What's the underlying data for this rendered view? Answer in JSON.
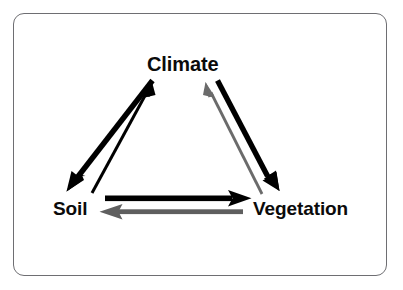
{
  "diagram": {
    "type": "cyclic-feedback-triangle",
    "title": "",
    "frame": {
      "shape": "rounded-rectangle",
      "border_color": "#6e6e72"
    },
    "nodes": [
      {
        "id": "climate",
        "label": "Climate",
        "position": "top"
      },
      {
        "id": "soil",
        "label": "Soil",
        "position": "bottom-left"
      },
      {
        "id": "vegetation",
        "label": "Vegetation",
        "position": "bottom-right"
      }
    ],
    "edges": [
      {
        "id": "climate-to-soil",
        "from": "Climate",
        "to": "Soil",
        "direction": "down-left",
        "weight": "thick",
        "color": "#000000"
      },
      {
        "id": "soil-to-climate",
        "from": "Soil",
        "to": "Climate",
        "direction": "up-right",
        "weight": "thin",
        "color": "#000000"
      },
      {
        "id": "climate-to-vegetation",
        "from": "Climate",
        "to": "Vegetation",
        "direction": "down-right",
        "weight": "thick",
        "color": "#000000"
      },
      {
        "id": "vegetation-to-climate",
        "from": "Vegetation",
        "to": "Climate",
        "direction": "up-left",
        "weight": "thin",
        "color": "#6b6b6b"
      },
      {
        "id": "soil-to-vegetation",
        "from": "Soil",
        "to": "Vegetation",
        "direction": "right",
        "weight": "thick",
        "color": "#000000"
      },
      {
        "id": "vegetation-to-soil",
        "from": "Vegetation",
        "to": "Soil",
        "direction": "left",
        "weight": "medium",
        "color": "#5f5f5f"
      }
    ],
    "colors": {
      "background": "#ffffff",
      "text": "#0b0b0b",
      "arrow_black": "#000000",
      "arrow_gray": "#6b6b6b",
      "arrow_gray_dark": "#5f5f5f",
      "frame_border": "#6e6e72"
    }
  }
}
